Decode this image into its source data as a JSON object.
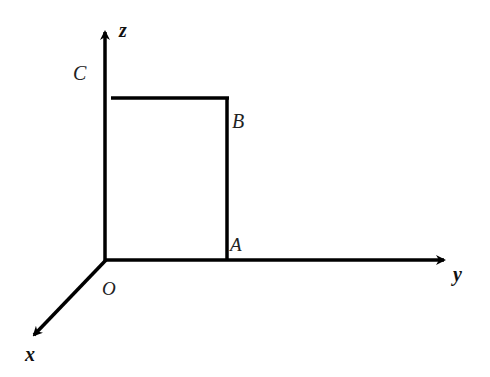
{
  "diagram": {
    "type": "3d-coordinate-axes",
    "axes": {
      "x": {
        "label": "x"
      },
      "y": {
        "label": "y"
      },
      "z": {
        "label": "z"
      }
    },
    "points": {
      "O": {
        "label": "O"
      },
      "A": {
        "label": "A"
      },
      "B": {
        "label": "B"
      },
      "C": {
        "label": "C"
      }
    },
    "segments": [
      "AB",
      "B to z-axis (horizontal at height of B)"
    ],
    "colors": {
      "line": "#000000",
      "background": "#ffffff"
    }
  }
}
